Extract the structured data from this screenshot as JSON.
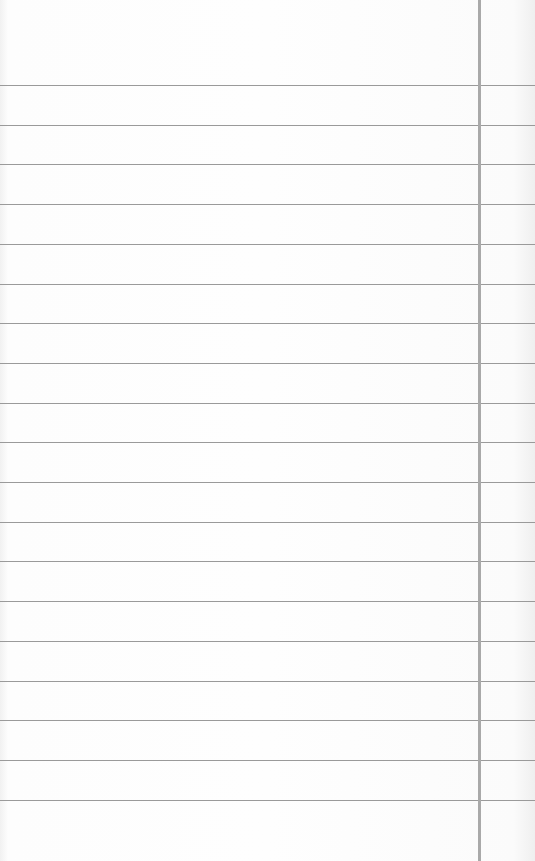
{
  "paper": {
    "type": "lined-notebook-paper",
    "background_color": "#fcfcfc",
    "rule_color": "#9a9a9a",
    "margin_line_color": "#a9a9a9",
    "first_rule_y": 85,
    "rule_spacing": 39.7,
    "rule_count": 19,
    "margin_line_x": 478
  }
}
